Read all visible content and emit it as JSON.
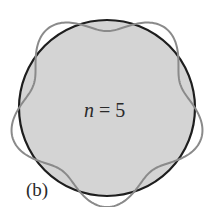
{
  "figure": {
    "center_label": "n = 5",
    "center_label_var": "n",
    "center_label_rest": " = 5",
    "panel_label": "(b)",
    "mode_number": 5,
    "colors": {
      "disk_fill": "#d4d4d4",
      "circle_stroke": "#1e1e1e",
      "wave_stroke": "#8a8a8a",
      "text": "#2a2a2a"
    }
  }
}
